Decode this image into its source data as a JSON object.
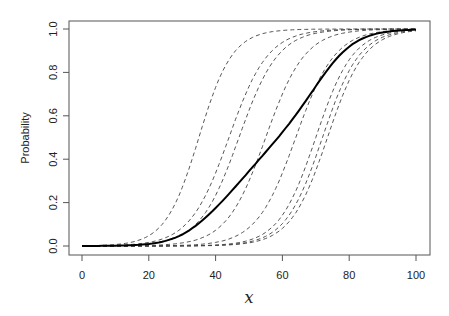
{
  "chart_data": {
    "type": "line",
    "title": "",
    "xlabel": "x",
    "ylabel": "Probability",
    "xlim": [
      0,
      100
    ],
    "ylim": [
      0,
      1
    ],
    "x_ticks": [
      0,
      20,
      40,
      60,
      80,
      100
    ],
    "x_tick_labels": [
      "0",
      "20",
      "40",
      "60",
      "80",
      "100"
    ],
    "y_ticks": [
      0,
      0.2,
      0.4,
      0.6,
      0.8,
      1.0
    ],
    "y_tick_labels": [
      "0.0",
      "0.2",
      "0.4",
      "0.6",
      "0.8",
      "1.0"
    ],
    "grid": false,
    "legend": null,
    "series": [
      {
        "name": "component-1",
        "style": "dashed",
        "model": "logistic",
        "center": 35,
        "slope": 0.2
      },
      {
        "name": "component-2",
        "style": "dashed",
        "model": "logistic",
        "center": 44,
        "slope": 0.17
      },
      {
        "name": "component-3",
        "style": "dashed",
        "model": "logistic",
        "center": 47,
        "slope": 0.17
      },
      {
        "name": "component-4",
        "style": "dashed",
        "model": "logistic",
        "center": 55,
        "slope": 0.17
      },
      {
        "name": "component-5",
        "style": "dashed",
        "model": "logistic",
        "center": 64,
        "slope": 0.17
      },
      {
        "name": "component-6",
        "style": "dashed",
        "model": "logistic",
        "center": 70,
        "slope": 0.18
      },
      {
        "name": "component-7",
        "style": "dashed",
        "model": "logistic",
        "center": 72,
        "slope": 0.18
      },
      {
        "name": "component-8",
        "style": "dashed",
        "model": "logistic",
        "center": 73.5,
        "slope": 0.18
      },
      {
        "name": "average",
        "style": "solid",
        "model": "mean-of-components",
        "x": [
          0,
          10,
          20,
          25,
          30,
          35,
          40,
          45,
          50,
          55,
          60,
          65,
          70,
          75,
          80,
          85,
          90,
          95,
          100
        ],
        "values": [
          0.0,
          0.0,
          0.01,
          0.02,
          0.05,
          0.11,
          0.2,
          0.3,
          0.4,
          0.5,
          0.61,
          0.71,
          0.81,
          0.9,
          0.95,
          0.98,
          0.99,
          0.995,
          0.995
        ]
      }
    ]
  }
}
